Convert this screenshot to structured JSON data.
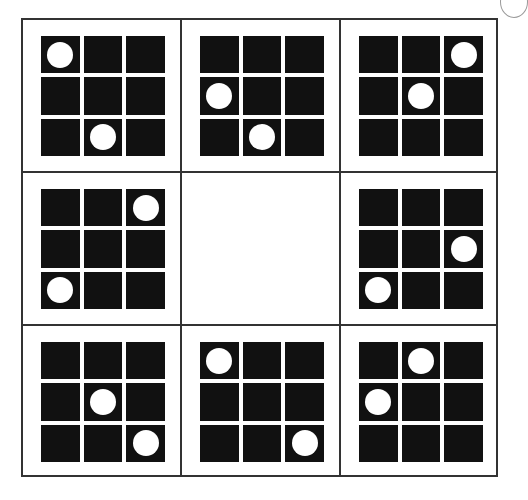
{
  "puzzle": {
    "title": "3x3 matrix puzzle with missing center",
    "rows": 3,
    "cols": 3,
    "tile_grid_size": 3,
    "colors": {
      "tile": "#111111",
      "dot": "#ffffff",
      "border": "#333333",
      "background": "#ffffff"
    },
    "missing_cell": [
      1,
      1
    ],
    "cells": [
      {
        "row": 0,
        "col": 0,
        "empty": false,
        "dots": [
          [
            0,
            0
          ],
          [
            2,
            1
          ]
        ]
      },
      {
        "row": 0,
        "col": 1,
        "empty": false,
        "dots": [
          [
            1,
            0
          ],
          [
            2,
            1
          ]
        ]
      },
      {
        "row": 0,
        "col": 2,
        "empty": false,
        "dots": [
          [
            0,
            2
          ],
          [
            1,
            1
          ]
        ]
      },
      {
        "row": 1,
        "col": 0,
        "empty": false,
        "dots": [
          [
            0,
            2
          ],
          [
            2,
            0
          ]
        ]
      },
      {
        "row": 1,
        "col": 1,
        "empty": true,
        "dots": []
      },
      {
        "row": 1,
        "col": 2,
        "empty": false,
        "dots": [
          [
            1,
            2
          ],
          [
            2,
            0
          ]
        ]
      },
      {
        "row": 2,
        "col": 0,
        "empty": false,
        "dots": [
          [
            1,
            1
          ],
          [
            2,
            2
          ]
        ]
      },
      {
        "row": 2,
        "col": 1,
        "empty": false,
        "dots": [
          [
            0,
            0
          ],
          [
            2,
            2
          ]
        ]
      },
      {
        "row": 2,
        "col": 2,
        "empty": false,
        "dots": [
          [
            0,
            1
          ],
          [
            1,
            0
          ]
        ]
      }
    ]
  }
}
